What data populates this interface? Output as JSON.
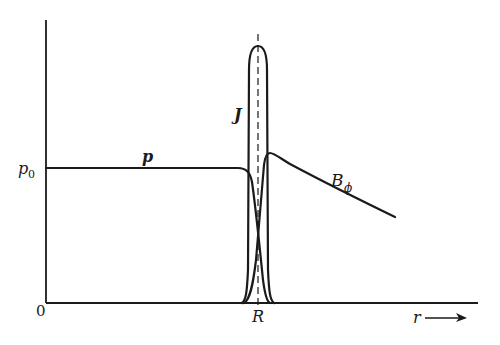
{
  "diagram": {
    "title": "",
    "labels": {
      "origin": "0",
      "p0": "p",
      "p0_sub": "0",
      "p_curve": "p",
      "J_curve": "J",
      "B_curve": "B",
      "B_sub": "ϕ",
      "R_tick": "R",
      "r_axis": "r",
      "r_arrow": "⟶"
    },
    "curves": [
      {
        "name": "p",
        "description": "pressure profile, flat at p0 inside, falls to zero near R"
      },
      {
        "name": "J",
        "description": "current density, sharp peak centered at R"
      },
      {
        "name": "B_phi",
        "description": "azimuthal magnetic field, zero inside, rises at R, decays outward"
      }
    ],
    "colors": {
      "ink": "#1a1a1a",
      "background": "#ffffff"
    }
  }
}
